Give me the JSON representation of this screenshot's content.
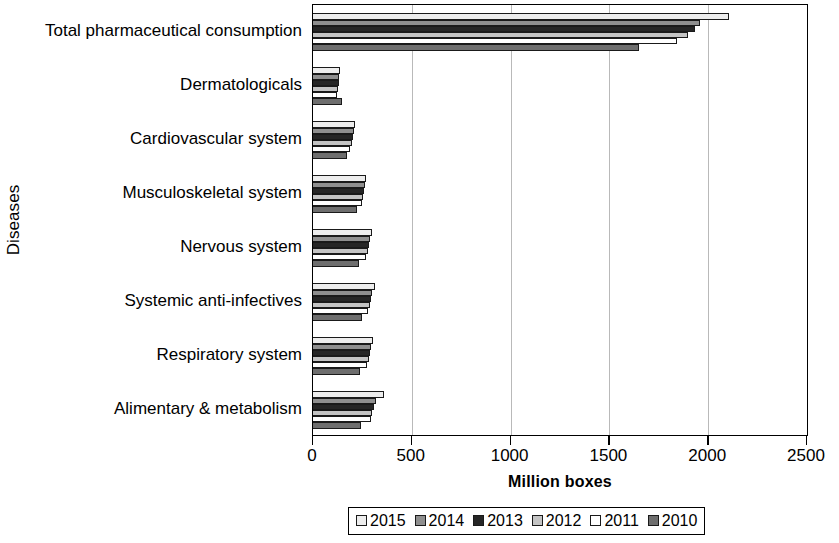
{
  "chart_data": {
    "type": "bar",
    "orientation": "horizontal",
    "title": "",
    "xlabel": "Million boxes",
    "ylabel": "Diseases",
    "xlim": [
      0,
      2500
    ],
    "xticks": [
      0,
      500,
      1000,
      1500,
      2000,
      2500
    ],
    "xtick_labels": [
      "0",
      "500",
      "1000",
      "1500",
      "2000",
      "2500"
    ],
    "grid": true,
    "grid_axis": "x",
    "legend_position": "bottom",
    "categories": [
      "Total pharmaceutical consumption",
      "Dermatologicals",
      "Cardiovascular system",
      "Musculoskeletal system",
      "Nervous system",
      "Systemic anti-infectives",
      "Respiratory system",
      "Alimentary & metabolism"
    ],
    "series": [
      {
        "name": "2015",
        "color": "#ededed",
        "values": [
          2105,
          135,
          215,
          270,
          300,
          315,
          305,
          360
        ]
      },
      {
        "name": "2014",
        "color": "#8f8f8f",
        "values": [
          1960,
          130,
          205,
          262,
          290,
          300,
          295,
          320
        ]
      },
      {
        "name": "2013",
        "color": "#262626",
        "values": [
          1935,
          130,
          200,
          258,
          285,
          295,
          290,
          310
        ]
      },
      {
        "name": "2012",
        "color": "#c4c4c4",
        "values": [
          1900,
          125,
          195,
          255,
          280,
          288,
          282,
          300
        ]
      },
      {
        "name": "2011",
        "color": "#ffffff",
        "values": [
          1840,
          120,
          185,
          248,
          270,
          280,
          275,
          292
        ]
      },
      {
        "name": "2010",
        "color": "#6e6e6e",
        "values": [
          1650,
          145,
          170,
          225,
          235,
          248,
          240,
          245
        ]
      }
    ]
  },
  "axis": {
    "y_title": "Diseases",
    "x_title": "Million boxes"
  },
  "legend": {
    "entries": [
      {
        "label": "2015",
        "color": "#ededed"
      },
      {
        "label": "2014",
        "color": "#8f8f8f"
      },
      {
        "label": "2013",
        "color": "#262626"
      },
      {
        "label": "2012",
        "color": "#c4c4c4"
      },
      {
        "label": "2011",
        "color": "#ffffff"
      },
      {
        "label": "2010",
        "color": "#6e6e6e"
      }
    ]
  }
}
